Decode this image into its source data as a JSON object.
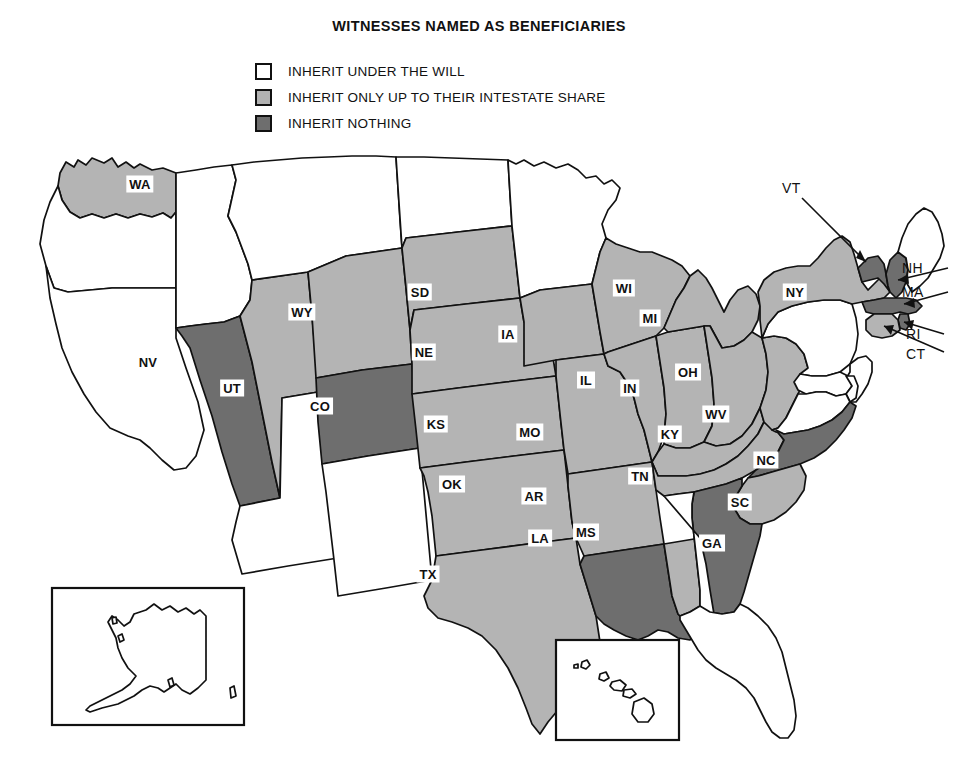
{
  "title": "WITNESSES NAMED AS BENEFICIARIES",
  "legend": {
    "items": [
      {
        "id": "inherit-under-will",
        "swatch": "white",
        "color": "#ffffff",
        "label": "INHERIT UNDER THE WILL"
      },
      {
        "id": "inherit-intestate-share",
        "swatch": "light-gray",
        "color": "#b4b4b4",
        "label": "INHERIT ONLY UP TO THEIR INTESTATE SHARE"
      },
      {
        "id": "inherit-nothing",
        "swatch": "dark-gray",
        "color": "#6e6e6e",
        "label": "INHERIT NOTHING"
      }
    ]
  },
  "map": {
    "region": "United States",
    "insets": [
      {
        "id": "alaska-inset",
        "label": "AK"
      },
      {
        "id": "hawaii-inset",
        "label": "HI"
      }
    ],
    "labels": {
      "WA": "WA",
      "NV": "NV",
      "UT": "UT",
      "WY": "WY",
      "CO": "CO",
      "SD": "SD",
      "NE": "NE",
      "KS": "KS",
      "OK": "OK",
      "TX": "TX",
      "IA": "IA",
      "MO": "MO",
      "AR": "AR",
      "LA": "LA",
      "MS": "MS",
      "WI": "WI",
      "IL": "IL",
      "IN": "IN",
      "MI": "MI",
      "OH": "OH",
      "KY": "KY",
      "TN": "TN",
      "WV": "WV",
      "NY": "NY",
      "NC": "NC",
      "SC": "SC",
      "GA": "GA",
      "VT": "VT",
      "NH": "NH",
      "MA": "MA",
      "RI": "RI",
      "CT": "CT"
    },
    "callout_labels": [
      "VT",
      "NH",
      "MA",
      "RI",
      "CT"
    ],
    "classification": {
      "inherit-under-will": [
        "CA",
        "OR",
        "ID",
        "MT",
        "ND",
        "MN",
        "AZ",
        "NM",
        "PA",
        "VA",
        "MD",
        "DE",
        "NJ",
        "AL",
        "FL",
        "ME",
        "AK",
        "HI"
      ],
      "inherit-intestate-share": [
        "WA",
        "WY",
        "UT",
        "SD",
        "NE",
        "KS",
        "OK",
        "TX",
        "IA",
        "MO",
        "AR",
        "MS",
        "WI",
        "IL",
        "IN",
        "MI",
        "OH",
        "KY",
        "TN",
        "WV",
        "NY",
        "SC",
        "CT"
      ],
      "inherit-nothing": [
        "NV",
        "CO",
        "LA",
        "NC",
        "GA",
        "VT",
        "NH",
        "MA",
        "RI"
      ]
    }
  }
}
